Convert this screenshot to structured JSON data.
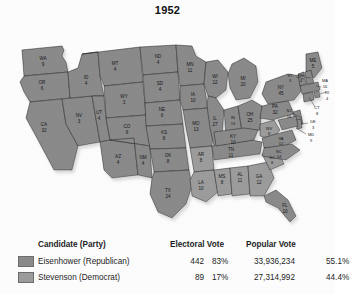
{
  "title": "1952",
  "colors": {
    "republican_fill": "#8a8a8a",
    "democrat_fill": "#9c9c9c",
    "state_border": "#2b2b2b",
    "water": "#ffffff",
    "map_shadow": "#b8b8b8"
  },
  "legend": {
    "headers": {
      "candidate": "Candidate (Party)",
      "electoral_vote": "Electoral Vote",
      "popular_vote": "Popular Vote"
    },
    "rows": [
      {
        "swatch": "republican-swatch",
        "candidate": "Eisenhower (Republican)",
        "electoral_votes": "442",
        "electoral_pct": "83%",
        "popular_votes": "33,936,234",
        "popular_pct": "55.1%"
      },
      {
        "swatch": "democrat-swatch",
        "candidate": "Stevenson (Democrat)",
        "electoral_votes": "89",
        "electoral_pct": "17%",
        "popular_votes": "27,314,992",
        "popular_pct": "44.4%"
      }
    ]
  },
  "map": {
    "states": [
      {
        "code": "WA",
        "ev": "9",
        "party": "republican"
      },
      {
        "code": "OR",
        "ev": "6",
        "party": "republican"
      },
      {
        "code": "CA",
        "ev": "32",
        "party": "republican"
      },
      {
        "code": "NV",
        "ev": "3",
        "party": "republican"
      },
      {
        "code": "ID",
        "ev": "4",
        "party": "republican"
      },
      {
        "code": "MT",
        "ev": "4",
        "party": "republican"
      },
      {
        "code": "WY",
        "ev": "3",
        "party": "republican"
      },
      {
        "code": "UT",
        "ev": "4",
        "party": "republican"
      },
      {
        "code": "AZ",
        "ev": "4",
        "party": "republican"
      },
      {
        "code": "CO",
        "ev": "6",
        "party": "republican"
      },
      {
        "code": "NM",
        "ev": "4",
        "party": "republican"
      },
      {
        "code": "ND",
        "ev": "4",
        "party": "republican"
      },
      {
        "code": "SD",
        "ev": "4",
        "party": "republican"
      },
      {
        "code": "NE",
        "ev": "6",
        "party": "republican"
      },
      {
        "code": "KS",
        "ev": "8",
        "party": "republican"
      },
      {
        "code": "OK",
        "ev": "8",
        "party": "republican"
      },
      {
        "code": "TX",
        "ev": "24",
        "party": "republican"
      },
      {
        "code": "MN",
        "ev": "11",
        "party": "republican"
      },
      {
        "code": "IA",
        "ev": "10",
        "party": "republican"
      },
      {
        "code": "MO",
        "ev": "13",
        "party": "republican"
      },
      {
        "code": "AR",
        "ev": "8",
        "party": "democrat"
      },
      {
        "code": "LA",
        "ev": "10",
        "party": "democrat"
      },
      {
        "code": "MS",
        "ev": "8",
        "party": "democrat"
      },
      {
        "code": "AL",
        "ev": "11",
        "party": "democrat"
      },
      {
        "code": "GA",
        "ev": "12",
        "party": "democrat"
      },
      {
        "code": "SC",
        "ev": "8",
        "party": "democrat"
      },
      {
        "code": "WI",
        "ev": "12",
        "party": "republican"
      },
      {
        "code": "IL",
        "ev": "27",
        "party": "republican"
      },
      {
        "code": "MI",
        "ev": "20",
        "party": "republican"
      },
      {
        "code": "IN",
        "ev": "13",
        "party": "republican"
      },
      {
        "code": "OH",
        "ev": "25",
        "party": "republican"
      },
      {
        "code": "KY",
        "ev": "10",
        "party": "republican"
      },
      {
        "code": "TN",
        "ev": "11",
        "party": "republican"
      },
      {
        "code": "WV",
        "ev": "8",
        "party": "democrat"
      },
      {
        "code": "VA",
        "ev": "12",
        "party": "republican"
      },
      {
        "code": "NC",
        "ev": "14",
        "party": "republican"
      },
      {
        "code": "FL",
        "ev": "10",
        "party": "republican"
      },
      {
        "code": "PA",
        "ev": "32",
        "party": "republican"
      },
      {
        "code": "NY",
        "ev": "45",
        "party": "republican"
      },
      {
        "code": "ME",
        "ev": "5",
        "party": "republican"
      },
      {
        "code": "VT",
        "ev": "3",
        "party": "republican"
      },
      {
        "code": "NH",
        "ev": "4",
        "party": "republican"
      },
      {
        "code": "MA",
        "ev": "16",
        "party": "republican"
      },
      {
        "code": "RI",
        "ev": "4",
        "party": "republican"
      },
      {
        "code": "CT",
        "ev": "8",
        "party": "republican"
      },
      {
        "code": "NJ",
        "ev": "16",
        "party": "republican"
      },
      {
        "code": "DE",
        "ev": "3",
        "party": "republican"
      },
      {
        "code": "MD",
        "ev": "9",
        "party": "republican"
      }
    ]
  }
}
